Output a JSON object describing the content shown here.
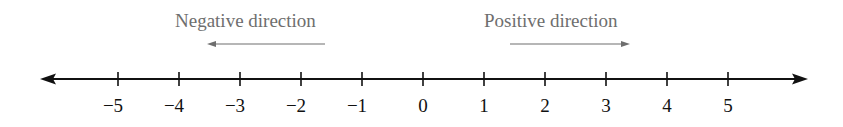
{
  "diagram": {
    "type": "number-line",
    "labels": {
      "negative": "Negative direction",
      "positive": "Positive direction"
    },
    "ticks": [
      {
        "value": -5,
        "label": "−5",
        "x": 118
      },
      {
        "value": -4,
        "label": "−4",
        "x": 179
      },
      {
        "value": -3,
        "label": "−3",
        "x": 240
      },
      {
        "value": -2,
        "label": "−2",
        "x": 301
      },
      {
        "value": -1,
        "label": "−1",
        "x": 362
      },
      {
        "value": 0,
        "label": "0",
        "x": 423
      },
      {
        "value": 1,
        "label": "1",
        "x": 484
      },
      {
        "value": 2,
        "label": "2",
        "x": 545
      },
      {
        "value": 3,
        "label": "3",
        "x": 606
      },
      {
        "value": 4,
        "label": "4",
        "x": 667
      },
      {
        "value": 5,
        "label": "5",
        "x": 728
      }
    ],
    "colors": {
      "axis": "#111111",
      "direction": "#6e6e6e"
    }
  }
}
